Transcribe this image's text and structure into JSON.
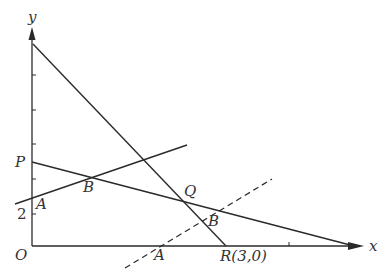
{
  "diagram": {
    "colors": {
      "stroke": "#2a2a2a",
      "text": "#333333",
      "background": "#ffffff"
    },
    "axes": {
      "x_label": "x",
      "y_label": "y",
      "origin_label": "O"
    },
    "y_tick_label": "2",
    "points": {
      "P": "P",
      "A_on_y_axis": "A",
      "B_upper": "B",
      "Q": "Q",
      "B_lower": "B",
      "A_on_x_axis": "A",
      "R": "R(3,0)"
    },
    "lines": [
      {
        "name": "steep-line",
        "from": "top of y-axis",
        "to": "R(3,0)",
        "style": "solid"
      },
      {
        "name": "line-PQ",
        "from": "P",
        "to": "x-axis end",
        "style": "solid"
      },
      {
        "name": "line-AB",
        "from": "A",
        "through": "B",
        "style": "solid"
      },
      {
        "name": "dashed-line",
        "through": [
          "A",
          "B"
        ],
        "style": "dashed"
      }
    ]
  }
}
